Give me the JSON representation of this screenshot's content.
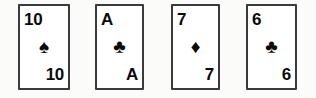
{
  "scene": {
    "title": "Playing card hand",
    "background_color": "#fbfbfa",
    "card_face_color": "#ffffff",
    "card_border_color": "#3a3a3c",
    "text_color": "#0a0a0a",
    "card_count": 4
  },
  "cards": [
    {
      "rank": "10",
      "suit_name": "spades",
      "suit_symbol": "♠",
      "suit_color": "#0a0a0a",
      "corner_top_left": "10",
      "corner_bottom_right": "10"
    },
    {
      "rank": "A",
      "suit_name": "clubs",
      "suit_symbol": "♣",
      "suit_color": "#0a0a0a",
      "corner_top_left": "A",
      "corner_bottom_right": "A"
    },
    {
      "rank": "7",
      "suit_name": "diamonds",
      "suit_symbol": "♦",
      "suit_color": "#0a0a0a",
      "corner_top_left": "7",
      "corner_bottom_right": "7"
    },
    {
      "rank": "6",
      "suit_name": "clubs",
      "suit_symbol": "♣",
      "suit_color": "#0a0a0a",
      "corner_top_left": "6",
      "corner_bottom_right": "6"
    }
  ]
}
